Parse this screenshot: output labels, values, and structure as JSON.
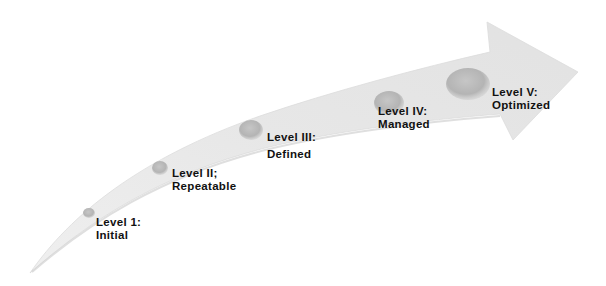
{
  "diagram": {
    "type": "maturity-arrow",
    "colors": {
      "arrow_fill": "#e9e9e9",
      "arrow_fill_light": "#f3f3f3",
      "arrow_shadow": "#d4d4d4",
      "ball": "#bdbdbd",
      "ball_dark": "#a9a9a9",
      "text": "#111111"
    },
    "levels": [
      {
        "id": "level-1",
        "title": "Level 1:",
        "subtitle": "Initial"
      },
      {
        "id": "level-2",
        "title": "Level II;",
        "subtitle": "Repeatable"
      },
      {
        "id": "level-3",
        "title": "Level III:",
        "subtitle": "Defined"
      },
      {
        "id": "level-4",
        "title": "Level IV:",
        "subtitle": "Managed"
      },
      {
        "id": "level-5",
        "title": "Level V:",
        "subtitle": "Optimized"
      }
    ]
  }
}
